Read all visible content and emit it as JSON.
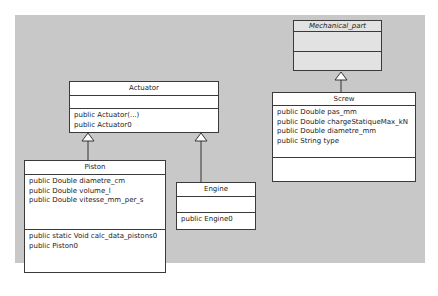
{
  "diagram": {
    "background": "#c8c8c8",
    "classes": {
      "mechanical_part": {
        "name": "Mechanical_part",
        "abstract": true,
        "attributes": [],
        "methods": []
      },
      "actuator": {
        "name": "Actuator",
        "attributes": [],
        "methods": [
          "public Actuator(...)",
          "public Actuator0"
        ]
      },
      "screw": {
        "name": "Screw",
        "attributes": [
          "public Double pas_mm",
          "public Double chargeStatiqueMax_kN",
          "public Double diametre_mm",
          "public String type"
        ],
        "methods": []
      },
      "piston": {
        "name": "Piston",
        "attributes": [
          "public Double diametre_cm",
          "public Double volume_l",
          "public Double vitesse_mm_per_s"
        ],
        "methods": [
          "public static Void calc_data_pistons0",
          "public Piston0"
        ]
      },
      "engine": {
        "name": "Engine",
        "attributes": [],
        "methods": [
          "public Engine0"
        ]
      }
    },
    "relations": [
      {
        "type": "generalization",
        "from": "Piston",
        "to": "Actuator"
      },
      {
        "type": "generalization",
        "from": "Engine",
        "to": "Actuator"
      },
      {
        "type": "generalization",
        "from": "Screw",
        "to": "Mechanical_part"
      }
    ]
  }
}
